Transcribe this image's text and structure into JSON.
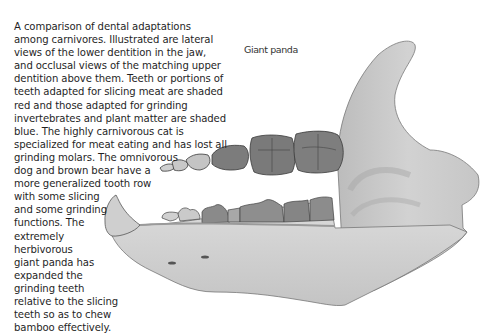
{
  "figure": {
    "label": "Giant panda",
    "caption_lines": [
      "A comparison of dental adaptations",
      "among carnivores. Illustrated are lateral",
      "views of the lower dentition in the jaw,",
      "and occlusal views of the matching upper",
      "dentition above them. Teeth or portions of",
      "teeth adapted for slicing meat are shaded",
      "red and those adapted for grinding",
      "invertebrates and plant matter are shaded",
      "blue. The highly carnivorous cat is",
      "specialized for meat eating and has lost all",
      "grinding molars. The omnivorous",
      "dog and brown bear have a",
      "more generalized tooth row",
      "with some slicing",
      "and some grinding",
      "functions. The",
      "extremely",
      "herbivorous",
      "giant panda has",
      "expanded the",
      "grinding teeth",
      "relative to the slicing",
      "teeth so as to chew",
      "bamboo effectively."
    ]
  },
  "colors": {
    "bone_light": "#d6d6d6",
    "bone_mid": "#bdbdbd",
    "tooth_dark": "#7a7a7a",
    "tooth_mid": "#9a9a9a",
    "outline": "#555555"
  }
}
